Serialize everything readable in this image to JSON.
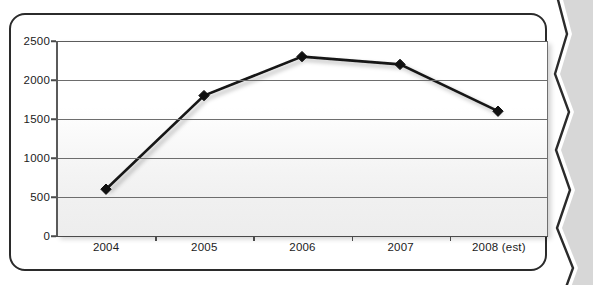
{
  "page": {
    "bleed_text": "and hit a new high of 2,300 units at the end of 2006,\nan increase of over 250 percent from 2004 levels.\nWhat had been a good year only became the worst\nThe result was that it went under for British rivals and\nname such as little Sharp and Trayton. People were also helped by increase\nof a much of people."
  },
  "frame": {
    "visible": true
  },
  "chart_data": {
    "type": "line",
    "title": "",
    "xlabel": "",
    "ylabel": "",
    "categories": [
      "2004",
      "2005",
      "2006",
      "2007",
      "2008 (est)"
    ],
    "values": [
      600,
      1800,
      2300,
      2200,
      1600
    ],
    "series": [
      {
        "name": "Units",
        "values": [
          600,
          1800,
          2300,
          2200,
          1600
        ]
      }
    ],
    "ylim": [
      0,
      2500
    ],
    "yticks": [
      0,
      500,
      1000,
      1500,
      2000,
      2500
    ],
    "ytick_labels": [
      "0",
      "500",
      "1000",
      "1500",
      "2000",
      "2500"
    ],
    "grid": true,
    "grid_axis": "y",
    "legend": false,
    "legend_position": "none",
    "marker": "diamond",
    "line_color": "#1a1a1a",
    "marker_color": "#111111",
    "plot_background": "#f2f2f2",
    "drop_shadow": true
  }
}
